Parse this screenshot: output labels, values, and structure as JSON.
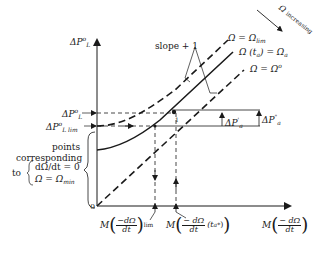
{
  "diagram": {
    "y_axis_label": {
      "main": "ΔP",
      "sup": "o",
      "sub": "L"
    },
    "x_axis_label": {
      "prefix": "M",
      "num": "− dΩ",
      "den": "dt"
    },
    "origin_label": "0",
    "left_ticks": {
      "dp_l": {
        "main": "ΔP",
        "sup": "o",
        "sub": "L"
      },
      "dp_l_lim": {
        "main": "ΔP",
        "sup": "o",
        "sub": "L lim"
      }
    },
    "brace_text": {
      "line1": "points",
      "line2": "corresponding",
      "to": "to",
      "cond1": "dΩ/dt = 0",
      "cond2_left": "Ω = Ω",
      "cond2_sub": "min"
    },
    "x_ticks": {
      "lim": {
        "prefix": "M",
        "num": "−dΩ",
        "den": "dt",
        "sub": "lim"
      },
      "ta": {
        "prefix": "M",
        "num": "− dΩ",
        "den": "dt",
        "suffix": "(t",
        "suffix_sub": "a",
        "suffix_sup": "*",
        "close": ")"
      }
    },
    "curves": [
      {
        "label_left": "Ω = Ω",
        "label_sub": "lim",
        "style": "dashed"
      },
      {
        "label_left": "Ω (t",
        "label_sub_mid": "a",
        "label_right": ") = Ω",
        "label_sub": "a",
        "style": "solid"
      },
      {
        "label_left": "Ω = Ω",
        "label_sup": "o",
        "style": "dashed"
      }
    ],
    "slope_label": "slope + 1",
    "omega_increasing": {
      "symbol": "Ω",
      "text": "increasing"
    },
    "right_annotations": {
      "dp_a_prime": {
        "main": "ΔP",
        "sup": "'",
        "sub": "a"
      },
      "dp_a_dprime": {
        "main": "ΔP",
        "sup": "\"",
        "sub": "a"
      }
    },
    "point_marker": "1",
    "colors": {
      "ink": "#1a1a1a",
      "background": "#ffffff"
    }
  }
}
